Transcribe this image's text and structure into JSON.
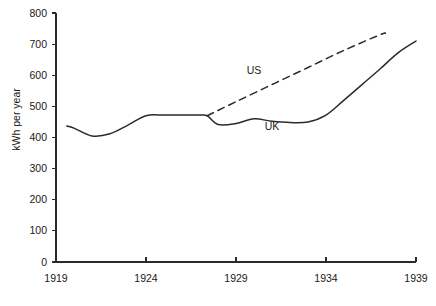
{
  "chart_data": {
    "type": "line",
    "title": "",
    "xlabel": "",
    "ylabel": "kWh per year",
    "xlim": [
      1919,
      1939
    ],
    "ylim": [
      0,
      800
    ],
    "grid": false,
    "legend_position": "inline-annotations",
    "xticks": [
      1919,
      1924,
      1929,
      1934,
      1939
    ],
    "xtick_labels": [
      "1919",
      "1924",
      "1929",
      "1934",
      "1939"
    ],
    "yticks": [
      0,
      100,
      200,
      300,
      400,
      500,
      600,
      700,
      800
    ],
    "ytick_labels": [
      "0",
      "100",
      "200",
      "300",
      "400",
      "500",
      "600",
      "700",
      "800"
    ],
    "series": [
      {
        "name": "UK",
        "style": "solid",
        "color": "#2b2b2b",
        "annotation": "UK",
        "annotation_x": 1931.0,
        "annotation_y": 425,
        "x": [
          1919.6,
          1920.0,
          1921.0,
          1922.0,
          1923.0,
          1924.0,
          1925.0,
          1926.0,
          1927.0,
          1927.4,
          1928.0,
          1929.0,
          1930.0,
          1931.0,
          1932.0,
          1933.0,
          1934.0,
          1935.0,
          1936.0,
          1937.0,
          1938.0,
          1939.0
        ],
        "y": [
          437,
          430,
          405,
          412,
          440,
          470,
          472,
          472,
          472,
          470,
          442,
          445,
          460,
          452,
          448,
          450,
          472,
          520,
          570,
          620,
          672,
          710
        ]
      },
      {
        "name": "US",
        "style": "dashed",
        "color": "#2b2b2b",
        "annotation": "US",
        "annotation_x": 1930.0,
        "annotation_y": 605,
        "x": [
          1927.4,
          1929.0,
          1931.0,
          1933.0,
          1935.0,
          1937.0,
          1937.3
        ],
        "y": [
          470,
          515,
          570,
          625,
          680,
          730,
          735
        ]
      }
    ]
  },
  "axis": {
    "y_axis_title": "kWh per year"
  }
}
